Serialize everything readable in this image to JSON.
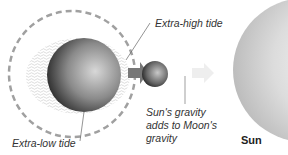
{
  "diagram": {
    "type": "spring-tide",
    "labels": {
      "extra_high_tide": "Extra-high tide",
      "extra_low_tide": "Extra-low tide",
      "gravity_line1": "Sun's gravity",
      "gravity_line2": "adds to Moon's",
      "gravity_line3": "gravity",
      "sun": "Sun"
    },
    "bodies": [
      "Earth",
      "Moon",
      "Sun"
    ],
    "colors": {
      "orbit": "#9a9a9a",
      "sun_light": "#f4f4f4",
      "sun_dark": "#c9c9c9",
      "earth_light": "#d0d0d0",
      "earth_dark": "#1a1a1a",
      "arrow": "#e6e6e6"
    }
  }
}
